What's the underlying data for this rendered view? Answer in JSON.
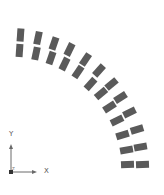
{
  "diagram": {
    "block_color": "#5a5a5a",
    "axis_color": "#6a6a6a",
    "block_size": {
      "tangent_width": 7,
      "radial_length": 13
    },
    "arc_center": [
      10,
      170
    ],
    "block_pairs": [
      {
        "outer": [
          20.5,
          35
        ],
        "inner": [
          19.5,
          50.5
        ],
        "rotation": 4
      },
      {
        "outer": [
          38,
          38
        ],
        "inner": [
          36,
          53.5
        ],
        "rotation": 12
      },
      {
        "outer": [
          54,
          43.5
        ],
        "inner": [
          51,
          58
        ],
        "rotation": 19
      },
      {
        "outer": [
          69.5,
          49.5
        ],
        "inner": [
          64.5,
          64
        ],
        "rotation": 26
      },
      {
        "outer": [
          85.5,
          59.5
        ],
        "inner": [
          78,
          72
        ],
        "rotation": 34
      },
      {
        "outer": [
          99,
          70.5
        ],
        "inner": [
          90.5,
          84
        ],
        "rotation": 42
      },
      {
        "outer": [
          111.5,
          84
        ],
        "inner": [
          101,
          93.5
        ],
        "rotation": 50
      },
      {
        "outer": [
          120.5,
          97.5
        ],
        "inner": [
          109.5,
          107
        ],
        "rotation": 57
      },
      {
        "outer": [
          129.5,
          112.5
        ],
        "inner": [
          117,
          120.5
        ],
        "rotation": 64
      },
      {
        "outer": [
          137,
          129.5
        ],
        "inner": [
          122.5,
          135
        ],
        "rotation": 73
      },
      {
        "outer": [
          140.5,
          147
        ],
        "inner": [
          126.5,
          150
        ],
        "rotation": 80
      },
      {
        "outer": [
          142.5,
          164.5
        ],
        "inner": [
          127.5,
          164.5
        ],
        "rotation": 88
      }
    ]
  },
  "axes": {
    "x_label": "X",
    "y_label": "Y",
    "z_label": "Z",
    "origin": [
      11,
      172
    ]
  }
}
